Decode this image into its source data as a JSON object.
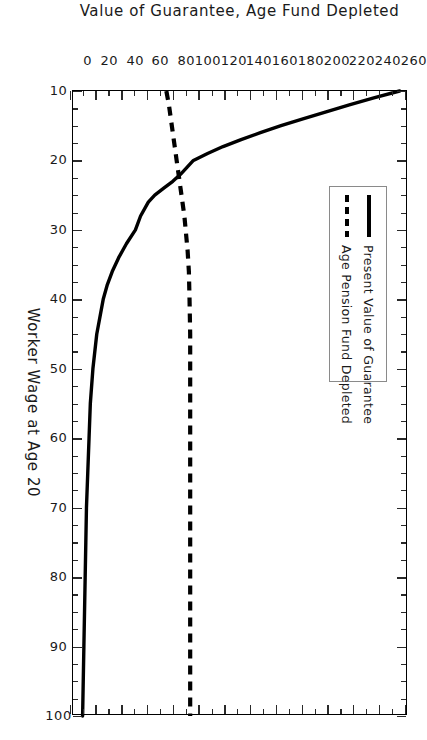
{
  "chart_data": {
    "type": "line",
    "title": "",
    "xlabel": "Worker Wage at Age 20",
    "ylabel": "Value of Guarantee, Age Fund Depleted",
    "xlim": [
      10,
      100
    ],
    "ylim": [
      0,
      260
    ],
    "xticks": [
      10,
      20,
      30,
      40,
      50,
      60,
      70,
      80,
      90,
      100
    ],
    "xticklabels": [
      "10",
      "20",
      "30",
      "40",
      "50",
      "60",
      "70",
      "80",
      "90",
      "100"
    ],
    "yticks": [
      0,
      20,
      40,
      60,
      80,
      100,
      120,
      140,
      160,
      180,
      200,
      220,
      240,
      260
    ],
    "yticklabels": [
      "0",
      "20",
      "40",
      "60",
      "80",
      "100",
      "120",
      "140",
      "160",
      "180",
      "200",
      "220",
      "240",
      "260"
    ],
    "x_minor_tick_step": 2.5,
    "y_minor_tick_step": 10,
    "grid": false,
    "legend_position": "upper right (figure space)",
    "rotation_deg": 90,
    "series": [
      {
        "name": "Present Value of Guarantee",
        "style": "solid",
        "color": "#000000",
        "x": [
          10,
          11,
          12,
          13,
          14,
          15,
          16,
          17,
          18,
          19,
          20,
          21,
          22,
          23,
          24,
          25,
          26,
          28,
          30,
          32,
          34,
          36,
          38,
          40,
          45,
          50,
          55,
          60,
          65,
          70,
          75,
          80,
          85,
          90,
          95,
          100
        ],
        "y": [
          255,
          235,
          216,
          198,
          180,
          163,
          147,
          132,
          118,
          106,
          95,
          90,
          85,
          79,
          72,
          65,
          60,
          54,
          50,
          43,
          37,
          32,
          28,
          25,
          20,
          17,
          15,
          14,
          13,
          12,
          11.5,
          11,
          10.5,
          10,
          9.5,
          9
        ]
      },
      {
        "name": "Age Pension Fund Depleted",
        "style": "dashed",
        "color": "#000000",
        "x": [
          10,
          12,
          14,
          16,
          18,
          20,
          22,
          24,
          26,
          28,
          30,
          33,
          36,
          40,
          45,
          50,
          55,
          60,
          65,
          70,
          75,
          80,
          85,
          90,
          95,
          100
        ],
        "y": [
          74,
          76,
          77.5,
          79,
          80.5,
          82,
          83.5,
          85,
          86.5,
          88,
          89,
          90.5,
          91.5,
          92,
          92.5,
          92.5,
          92.5,
          92.5,
          92.5,
          92.5,
          92.5,
          92.5,
          92.5,
          92.5,
          92.5,
          92.5
        ]
      }
    ]
  },
  "legend": {
    "entries": [
      {
        "label": "Present Value of Guarantee",
        "swatch": "solid-line-swatch"
      },
      {
        "label": "Age Pension Fund Depleted",
        "swatch": "dashed-line-swatch"
      }
    ]
  }
}
